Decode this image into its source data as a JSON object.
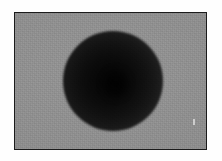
{
  "figure": {
    "caption": "",
    "alt_text": "Dark spherical particle on a uniform gray field",
    "frame_border_color": "#1b1b1b",
    "page_background": "#fefefe",
    "background_color": "#8b8b8b"
  },
  "image": {
    "subject_name": "dark-sphere",
    "subject_color_center": "#050505",
    "subject_color_edge": "#7a7a7a",
    "core_label": "",
    "speck_label": ""
  },
  "chart_data": {
    "type": "heatmap",
    "title": "",
    "xlabel": "",
    "ylabel": "",
    "grid": false,
    "legend": "none",
    "frame": {
      "x": 14,
      "y": 12,
      "width": 193,
      "height": 138
    },
    "objects": [
      {
        "name": "dark-sphere",
        "shape": "circle",
        "center_x": 112,
        "center_y": 80,
        "radius": 50,
        "min_intensity": 5,
        "edge_intensity": 122,
        "falloff": "radial-smooth"
      },
      {
        "name": "dark-core",
        "shape": "ellipse",
        "center_x": 115,
        "center_y": 83,
        "radius_x": 13,
        "radius_y": 15,
        "min_intensity": 2
      },
      {
        "name": "bright-speck",
        "shape": "rect",
        "center_x": 193,
        "center_y": 121,
        "width": 2,
        "height": 6,
        "intensity": 216
      }
    ],
    "background_intensity": 139,
    "intensity_range": [
      0,
      255
    ]
  }
}
